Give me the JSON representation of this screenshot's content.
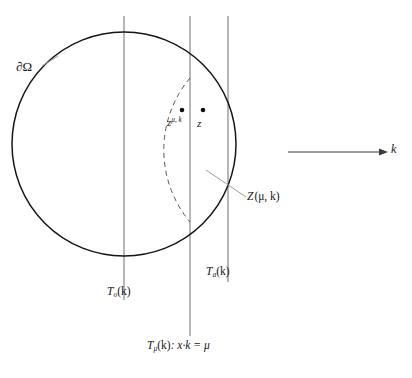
{
  "figure": {
    "title": "",
    "type": "geometric-diagram",
    "background_color": "#ffffff",
    "stroke_color": "#1a1a1a",
    "leader_color": "#8c8c8c"
  },
  "labels": {
    "domain_boundary": "∂Ω",
    "point_z_mu_k_base": "z",
    "point_z_mu_k_sup": "μ, k",
    "point_z": "z",
    "zone_Z": "Z",
    "zone_Z_args": "(μ, k)",
    "plane_T_base": "T",
    "plane_T_o_sub": "o",
    "plane_T_o_arg": "(k)",
    "plane_T_a_sub": "a",
    "plane_T_a_arg": "(k)",
    "plane_T_mu_sub": "μ",
    "plane_T_mu_arg": "(k)",
    "plane_T_mu_equation": ": x·k = μ",
    "vector_k": "k"
  },
  "geometry": {
    "circle": {
      "cx": 124,
      "cy": 144,
      "r": 112
    },
    "vertical_lines": [
      {
        "name": "T_o(k)",
        "x": 124,
        "y1": 16,
        "y2": 300
      },
      {
        "name": "T_mu(k)",
        "x": 190,
        "y1": 16,
        "y2": 336
      },
      {
        "name": "T_a(k)",
        "x": 228,
        "y1": 16,
        "y2": 282
      }
    ],
    "dashed_arc": {
      "start": {
        "x": 190,
        "y": 78
      },
      "end": {
        "x": 190,
        "y": 222
      },
      "bulge_x": 158
    },
    "points": [
      {
        "name": "z^{mu,k}",
        "x": 182,
        "y": 110
      },
      {
        "name": "z",
        "x": 203,
        "y": 110
      }
    ],
    "k_arrow": {
      "x1": 288,
      "y1": 152,
      "x2": 385,
      "y2": 152
    },
    "leader_line": {
      "x1": 206,
      "y1": 170,
      "x2": 245,
      "y2": 196
    }
  }
}
